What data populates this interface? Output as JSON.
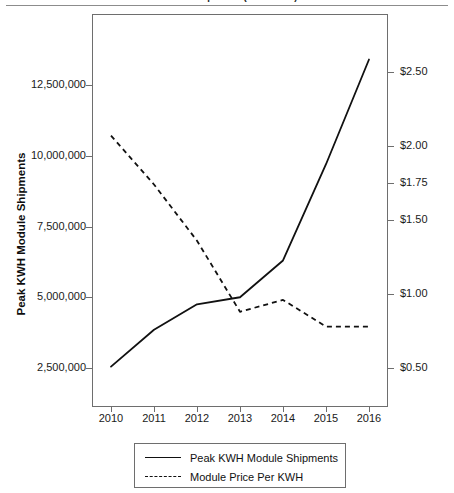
{
  "chart_data": {
    "type": "line",
    "title": "Module Shipments (Peak KWH)",
    "xlabel": "",
    "ylabel": "Peak KWH Module Shipments",
    "ylabel_right": "",
    "grid": false,
    "legend_position": "bottom",
    "categories": [
      "2010",
      "2011",
      "2012",
      "2013",
      "2014",
      "2015",
      "2016"
    ],
    "x": [
      2010,
      2011,
      2012,
      2013,
      2014,
      2015,
      2016
    ],
    "ylim": [
      1500000,
      14250000
    ],
    "ylim_right": [
      0.33,
      2.67
    ],
    "yticks": [
      2500000,
      5000000,
      7500000,
      10000000,
      12500000
    ],
    "ytick_labels": [
      "2,500,000",
      "5,000,000",
      "7,500,000",
      "10,000,000",
      "12,500,000"
    ],
    "yticks_right": [
      0.5,
      1.0,
      1.5,
      1.75,
      2.0,
      2.5
    ],
    "ytick_labels_right": [
      "$0.50",
      "$1.00",
      "$1.50",
      "$1.75",
      "$2.00",
      "$2.50"
    ],
    "series": [
      {
        "name": "Peak KWH Module Shipments",
        "axis": "left",
        "style": "solid",
        "color": "#111111",
        "values": [
          2550000,
          3850000,
          4750000,
          5000000,
          6300000,
          9700000,
          13400000
        ]
      },
      {
        "name": "Module Price Per KWH",
        "axis": "right",
        "style": "dashed",
        "color": "#111111",
        "values": [
          2.07,
          1.74,
          1.36,
          0.88,
          0.96,
          0.78,
          0.78
        ]
      }
    ]
  },
  "axes": {
    "left_title": "Peak KWH Module Shipments",
    "x_tick_labels": [
      "2010",
      "2011",
      "2012",
      "2013",
      "2014",
      "2015",
      "2016"
    ],
    "left_tick_labels": [
      "12,500,000",
      "10,000,000",
      "7,500,000",
      "5,000,000",
      "2,500,000"
    ],
    "right_tick_labels": [
      "$2.50",
      "$2.00",
      "$1.75",
      "$1.50",
      "$1.00",
      "$0.50"
    ]
  },
  "legend": {
    "items": [
      {
        "label": "Peak KWH Module Shipments",
        "style": "solid"
      },
      {
        "label": "Module Price Per KWH",
        "style": "dashed"
      }
    ]
  }
}
